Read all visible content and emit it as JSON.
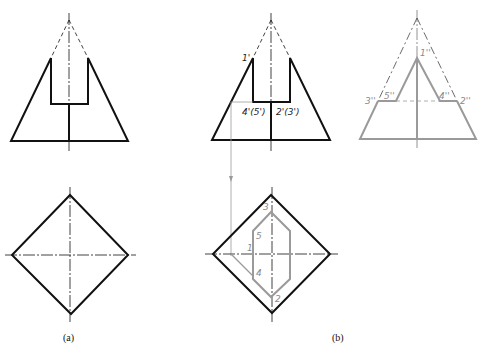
{
  "figure": {
    "captions": {
      "a": "(a)",
      "b": "(b)"
    },
    "colors": {
      "stroke": "#111111",
      "secondary": "#9a9a9a",
      "label_gray": "#8a8a8a"
    },
    "view_b_front_labels": {
      "p1": "1'",
      "p4_5": "4'(5')",
      "p2_3": "2'(3')"
    },
    "view_b_side_labels": {
      "p1": "1''",
      "p3": "3''",
      "p5": "5''",
      "p4": "4''",
      "p2": "2''"
    },
    "view_b_top_labels": {
      "p1": "1",
      "p2": "2",
      "p3": "3",
      "p4": "4",
      "p5": "5"
    }
  }
}
